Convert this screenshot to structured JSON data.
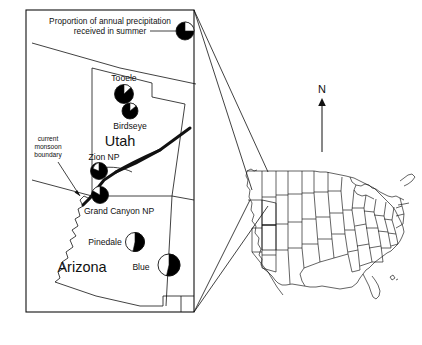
{
  "figure": {
    "legend": {
      "line1": "Proportion of annual precipitation",
      "line2": "received in summer",
      "symbol_name": "pie-symbol"
    },
    "annotations": {
      "monsoon_boundary": [
        "current",
        "monsoon",
        "boundary"
      ],
      "north_arrow_label": "N"
    },
    "state_labels": [
      {
        "name": "Utah",
        "text": "Utah"
      },
      {
        "name": "Arizona",
        "text": "Arizona"
      }
    ],
    "sites": [
      {
        "name": "Tooele",
        "label": "Tooele",
        "summer_fraction_black": 0.8
      },
      {
        "name": "Birdseye",
        "label": "Birdseye",
        "summer_fraction_black": 0.78
      },
      {
        "name": "Zion NP",
        "label": "Zion NP",
        "summer_fraction_black": 0.72
      },
      {
        "name": "Grand Canyon NP",
        "label": "Grand Canyon NP",
        "summer_fraction_black": 0.7
      },
      {
        "name": "Pinedale",
        "label": "Pinedale",
        "summer_fraction_black": 0.52
      },
      {
        "name": "Blue",
        "label": "Blue",
        "summer_fraction_black": 0.54
      }
    ],
    "colors": {
      "ink": "#000000",
      "paper": "#ffffff",
      "wedge_fill": "#000000",
      "wedge_empty": "#ffffff"
    }
  }
}
